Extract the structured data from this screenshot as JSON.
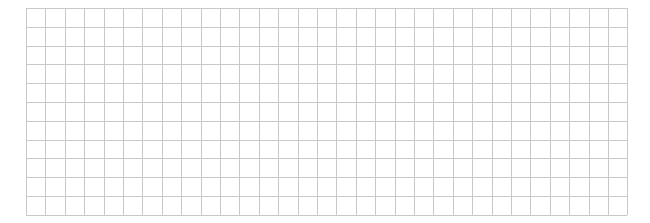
{
  "grid": {
    "columns": 31,
    "rows": 11,
    "cell_width": 19.4,
    "cell_height": 18.8,
    "line_color": "#c8c8c8",
    "background": "#ffffff"
  }
}
